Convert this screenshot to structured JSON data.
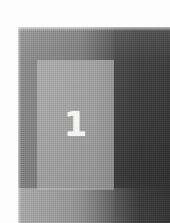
{
  "image": {
    "kind": "scanned-grayscale-figure",
    "caption_number": "1",
    "margins": {
      "top_label": "white page margin",
      "left_label": "white page margin"
    }
  },
  "figure": {
    "numeral_label": "1",
    "panel_label": "light-gray-panel",
    "field_label": "dark-gray-field",
    "band_label": "dark-right-band"
  },
  "colors": {
    "paper": "#fdfdfd",
    "field_light": "#8d8d8d",
    "field_dark": "#454545",
    "panel": "#a2a2a2",
    "numeral": "#f4f4f2",
    "band": "#2e2e2e"
  }
}
